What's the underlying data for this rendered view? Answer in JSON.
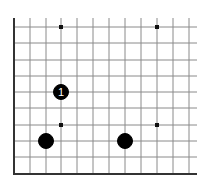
{
  "board": {
    "description": "Go board corner diagram (lower-left corner)",
    "grid_x": [
      14,
      30,
      46,
      61,
      77,
      93,
      109,
      125,
      141,
      157,
      173,
      189
    ],
    "grid_y": [
      27,
      43,
      60,
      76,
      92,
      108,
      125,
      141,
      157,
      174
    ],
    "left_edge_top": 18,
    "right_extent": 197,
    "line_color": "#8a8a8a",
    "edge_color": "#333333",
    "star_points": [
      {
        "x": 61,
        "y": 27
      },
      {
        "x": 157,
        "y": 27
      },
      {
        "x": 61,
        "y": 125
      },
      {
        "x": 157,
        "y": 125
      }
    ],
    "stones": [
      {
        "color": "black",
        "x": 61,
        "y": 92,
        "label": "1",
        "label_color": "#ffffff"
      },
      {
        "color": "black",
        "x": 46,
        "y": 141,
        "label": ""
      },
      {
        "color": "black",
        "x": 125,
        "y": 141,
        "label": ""
      }
    ]
  }
}
